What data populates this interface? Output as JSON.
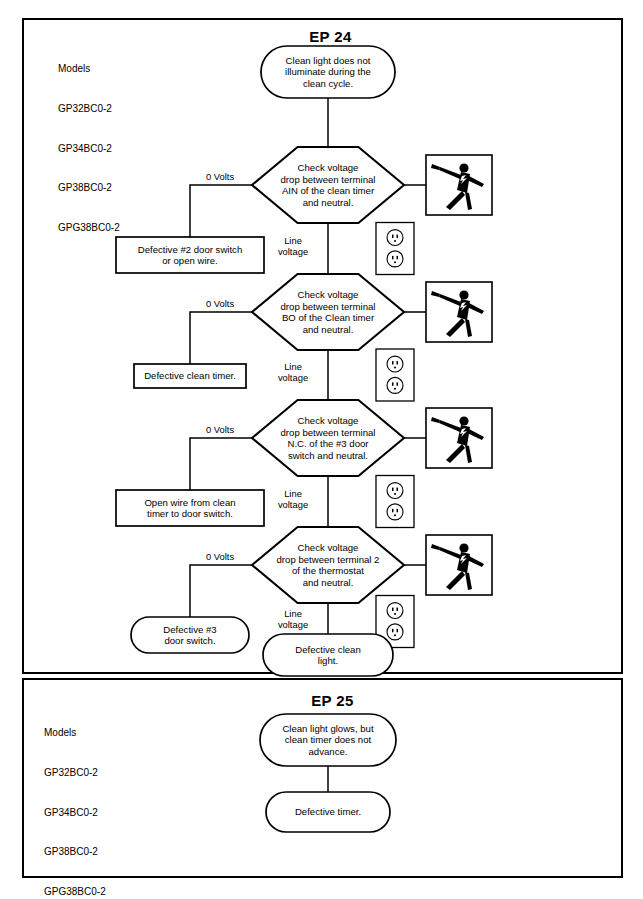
{
  "document": {
    "type": "troubleshooting-flowchart",
    "panels": [
      "EP 24",
      "EP 25"
    ]
  },
  "panel_ep24": {
    "title": "EP 24",
    "models_heading": "Models",
    "models": [
      "GP32BC0-2",
      "GP34BC0-2",
      "GP38BC0-2",
      "GPG38BC0-2"
    ],
    "start": {
      "shape": "rounded",
      "lines": [
        "Clean light does not",
        "illuminate during the",
        "clean cycle."
      ]
    },
    "steps": [
      {
        "id": "step-1",
        "decision": {
          "shape": "hexagon",
          "lines": [
            "Check voltage",
            "drop between terminal",
            "AIN of the clean timer",
            "and neutral."
          ]
        },
        "branch_left_label": "0 Volts",
        "branch_left_result": {
          "shape": "rect",
          "lines": [
            "Defective #2 door switch",
            "or open wire."
          ]
        },
        "branch_down_label": [
          "Line",
          "voltage"
        ],
        "hazard_icon": "electric-shock-icon",
        "outlet_icon": "duplex-outlet-icon"
      },
      {
        "id": "step-2",
        "decision": {
          "shape": "hexagon",
          "lines": [
            "Check voltage",
            "drop between terminal",
            "BO of the Clean timer",
            "and neutral."
          ]
        },
        "branch_left_label": "0 Volts",
        "branch_left_result": {
          "shape": "rect",
          "lines": [
            "Defective clean timer."
          ]
        },
        "branch_down_label": [
          "Line",
          "voltage"
        ],
        "hazard_icon": "electric-shock-icon",
        "outlet_icon": "duplex-outlet-icon"
      },
      {
        "id": "step-3",
        "decision": {
          "shape": "hexagon",
          "lines": [
            "Check voltage",
            "drop between terminal",
            "N.C. of the #3 door",
            "switch and neutral."
          ]
        },
        "branch_left_label": "0 Volts",
        "branch_left_result": {
          "shape": "rect",
          "lines": [
            "Open wire from clean",
            "timer to door switch."
          ]
        },
        "branch_down_label": [
          "Line",
          "voltage"
        ],
        "hazard_icon": "electric-shock-icon",
        "outlet_icon": "duplex-outlet-icon"
      },
      {
        "id": "step-4",
        "decision": {
          "shape": "hexagon",
          "lines": [
            "Check voltage",
            "drop between terminal 2",
            "of the thermostat",
            "and neutral."
          ]
        },
        "branch_left_label": "0 Volts",
        "branch_left_result": {
          "shape": "rounded",
          "lines": [
            "Defective #3",
            "door switch."
          ]
        },
        "branch_down_label": [
          "Line",
          "voltage"
        ],
        "hazard_icon": "electric-shock-icon",
        "outlet_icon": "duplex-outlet-icon"
      }
    ],
    "end": {
      "shape": "rounded",
      "lines": [
        "Defective clean",
        "light."
      ]
    }
  },
  "panel_ep25": {
    "title": "EP 25",
    "models_heading": "Models",
    "models": [
      "GP32BC0-2",
      "GP34BC0-2",
      "GP38BC0-2",
      "GPG38BC0-2"
    ],
    "start": {
      "shape": "rounded",
      "lines": [
        "Clean light glows, but",
        "clean timer does not",
        "advance."
      ]
    },
    "end": {
      "shape": "rounded",
      "lines": [
        "Defective timer."
      ]
    }
  },
  "colors": {
    "ink": "#000000",
    "paper": "#ffffff"
  }
}
